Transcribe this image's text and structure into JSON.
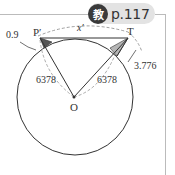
{
  "badge": {
    "icon_char": "教",
    "page_ref": "p.117"
  },
  "diagram": {
    "labels": {
      "p_prime": "P′",
      "t": "T",
      "x_prime": "x′",
      "o": "O",
      "radius_left": "6378",
      "radius_right": "6378",
      "height_left": "0.9",
      "height_right": "3.776"
    },
    "colors": {
      "line": "#333333",
      "dash": "#888888",
      "shade_dark": "#555555",
      "shade_light": "#b5b5b5"
    }
  }
}
